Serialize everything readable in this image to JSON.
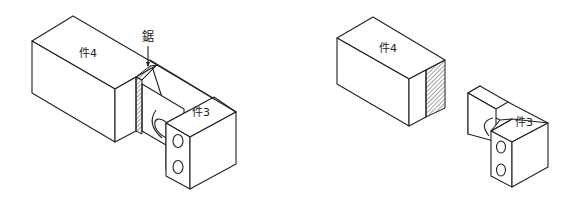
{
  "figure": {
    "left": {
      "part_a_label": "件4",
      "part_b_label": "件3",
      "callout_label": "鋸",
      "description": "assembled view: part 4 joined to part 3 with saw cut"
    },
    "right": {
      "part_a_label": "件4",
      "part_b_label": "件3",
      "description": "exploded view: part 4 with hatched sawn face separated from part 3"
    }
  },
  "colors": {
    "line": "#222222",
    "background": "#ffffff"
  }
}
